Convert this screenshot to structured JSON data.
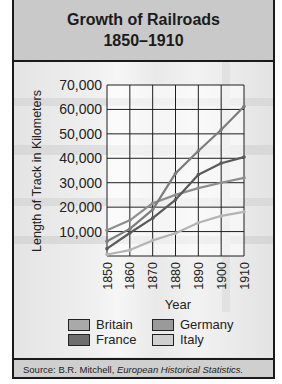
{
  "title": {
    "line1": "Growth of Railroads",
    "line2": "1850–1910"
  },
  "source": {
    "prefix": "Source: B.R. Mitchell, ",
    "work": "European Historical Statistics."
  },
  "legend": {
    "items": [
      {
        "label": "Britain",
        "color": "#a9a9a9"
      },
      {
        "label": "Germany",
        "color": "#9a9a9a"
      },
      {
        "label": "France",
        "color": "#6d6d6d"
      },
      {
        "label": "Italy",
        "color": "#cfcfcf"
      }
    ]
  },
  "chart_data": {
    "type": "line",
    "title": "Growth of Railroads 1850–1910",
    "xlabel": "Year",
    "ylabel": "Length of Track in Kilometers",
    "categories": [
      "1850",
      "1860",
      "1870",
      "1880",
      "1890",
      "1900",
      "1910"
    ],
    "y_ticks": [
      "10,000",
      "20,000",
      "30,000",
      "40,000",
      "50,000",
      "60,000",
      "70,000"
    ],
    "ylim": [
      0,
      70000
    ],
    "grid": true,
    "legend_position": "bottom",
    "series": [
      {
        "name": "Britain",
        "color": "#8e8e8e",
        "values": [
          10500,
          14600,
          21600,
          25000,
          27800,
          30000,
          32000
        ]
      },
      {
        "name": "France",
        "color": "#5a5a5a",
        "values": [
          3000,
          9400,
          15500,
          23000,
          33300,
          38000,
          40500
        ]
      },
      {
        "name": "Germany",
        "color": "#7d7d7d",
        "values": [
          6000,
          11100,
          19000,
          33800,
          43000,
          51700,
          61200
        ]
      },
      {
        "name": "Italy",
        "color": "#b4b4b4",
        "values": [
          600,
          2400,
          6400,
          9300,
          13600,
          16400,
          18100
        ]
      }
    ],
    "source": "B.R. Mitchell, European Historical Statistics."
  }
}
